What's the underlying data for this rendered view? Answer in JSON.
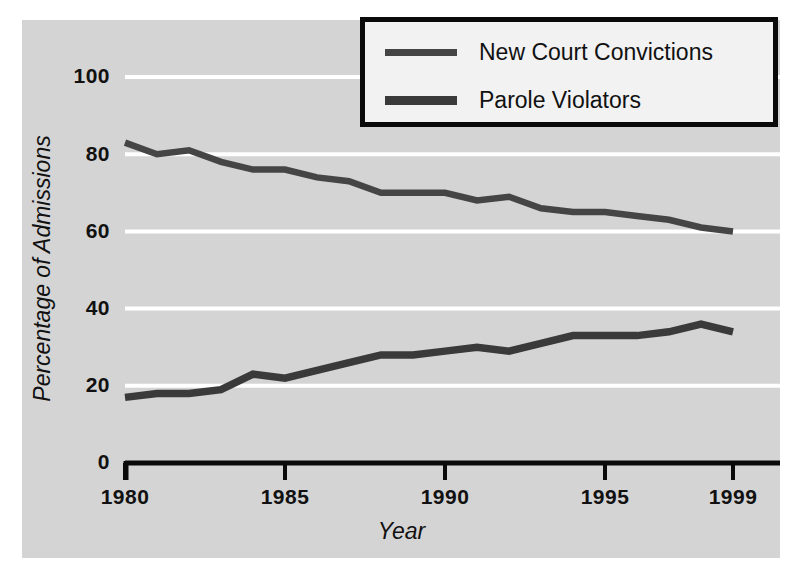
{
  "chart_data": {
    "type": "line",
    "title": "",
    "xlabel": "Year",
    "ylabel": "Percentage of Admissions",
    "xlim": [
      1980,
      1999
    ],
    "ylim": [
      0,
      100
    ],
    "grid": true,
    "legend_position": "top-right",
    "x": [
      1980,
      1981,
      1982,
      1983,
      1984,
      1985,
      1986,
      1987,
      1988,
      1989,
      1990,
      1991,
      1992,
      1993,
      1994,
      1995,
      1996,
      1997,
      1998,
      1999
    ],
    "xtick_labels": [
      "1980",
      "1985",
      "1990",
      "1995",
      "1999"
    ],
    "xticks": [
      1980,
      1985,
      1990,
      1995,
      1999
    ],
    "ytick_labels": [
      "0",
      "20",
      "40",
      "60",
      "80",
      "100"
    ],
    "yticks": [
      0,
      20,
      40,
      60,
      80,
      100
    ],
    "series": [
      {
        "name": "New Court Convictions",
        "color": "#454545",
        "values": [
          83,
          80,
          81,
          78,
          76,
          76,
          74,
          73,
          70,
          70,
          70,
          68,
          69,
          66,
          65,
          65,
          64,
          63,
          61,
          60
        ]
      },
      {
        "name": "Parole Violators",
        "color": "#3a3a3a",
        "values": [
          17,
          18,
          18,
          19,
          23,
          22,
          24,
          26,
          28,
          28,
          29,
          30,
          29,
          31,
          33,
          33,
          33,
          34,
          36,
          34
        ]
      }
    ]
  },
  "axes": {
    "y_title": "Percentage of Admissions",
    "x_title": "Year",
    "y_ticks": [
      "100",
      "80",
      "60",
      "40",
      "20",
      "0"
    ],
    "x_ticks": [
      "1980",
      "1985",
      "1990",
      "1995",
      "1999"
    ]
  },
  "legend": {
    "items": [
      {
        "label": "New Court Convictions"
      },
      {
        "label": "Parole Violators"
      }
    ]
  },
  "colors": {
    "panel_background": "#d4d4d4",
    "page_background": "#ffffff",
    "gridline": "#ffffff",
    "axis": "#0a0a0a",
    "series_1": "#454545",
    "series_2": "#3a3a3a",
    "legend_border": "#0a0a0a",
    "legend_background": "#f2f2f2",
    "text": "#111111"
  }
}
